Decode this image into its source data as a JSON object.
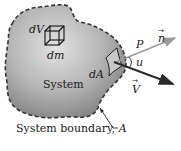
{
  "diagram": {
    "labels": {
      "dV": "dV",
      "dm": "dm",
      "dA": "dA",
      "system": "System",
      "P": "P",
      "n": "n",
      "u": "u",
      "V": "V",
      "boundary": "System boundary, ",
      "boundary_symbol": "A"
    },
    "colors": {
      "fill_light": "#d4d4d4",
      "fill_dark": "#8a8a8a",
      "boundary": "#333333",
      "normal_arrow": "#9a9a9a",
      "velocity_arrow": "#2a2a2a",
      "dA_patch": "#c8c8c8"
    }
  }
}
